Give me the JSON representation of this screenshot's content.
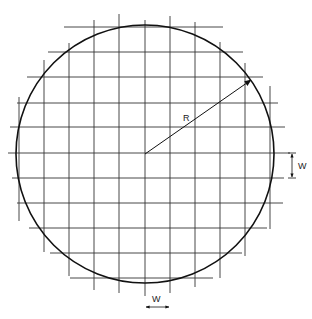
{
  "diagram": {
    "type": "wafer-grid",
    "circle": {
      "cx": 145,
      "cy": 154,
      "r": 129,
      "stroke": "#111111"
    },
    "grid": {
      "pitch_label": "W",
      "vertical_lines": [
        {
          "x": 19,
          "y1": 97,
          "y2": 221
        },
        {
          "x": 44,
          "y1": 60,
          "y2": 252
        },
        {
          "x": 69,
          "y1": 43,
          "y2": 276
        },
        {
          "x": 94,
          "y1": 20,
          "y2": 290
        },
        {
          "x": 119,
          "y1": 14,
          "y2": 293
        },
        {
          "x": 145,
          "y1": 20,
          "y2": 296
        },
        {
          "x": 170,
          "y1": 16,
          "y2": 293
        },
        {
          "x": 195,
          "y1": 22,
          "y2": 287
        },
        {
          "x": 220,
          "y1": 42,
          "y2": 278
        },
        {
          "x": 245,
          "y1": 63,
          "y2": 256
        },
        {
          "x": 270,
          "y1": 86,
          "y2": 229
        }
      ],
      "horizontal_lines": [
        {
          "y": 27,
          "x1": 64,
          "x2": 223
        },
        {
          "y": 52,
          "x1": 48,
          "x2": 243
        },
        {
          "y": 77,
          "x1": 27,
          "x2": 263
        },
        {
          "y": 103,
          "x1": 17,
          "x2": 278
        },
        {
          "y": 127,
          "x1": 10,
          "x2": 285
        },
        {
          "y": 153,
          "x1": 8,
          "x2": 290
        },
        {
          "y": 178,
          "x1": 12,
          "x2": 284
        },
        {
          "y": 203,
          "x1": 17,
          "x2": 283
        },
        {
          "y": 228,
          "x1": 29,
          "x2": 267
        },
        {
          "y": 253,
          "x1": 50,
          "x2": 242
        },
        {
          "y": 278,
          "x1": 70,
          "x2": 213
        }
      ],
      "stroke": "#333333"
    },
    "radius": {
      "label": "R",
      "from": [
        145,
        154
      ],
      "to": [
        251,
        80
      ]
    },
    "dim_vertical": {
      "label": "W",
      "x": 292,
      "y1": 153,
      "y2": 178
    },
    "dim_horizontal": {
      "label": "W",
      "y": 307,
      "x1": 145,
      "x2": 170
    }
  }
}
